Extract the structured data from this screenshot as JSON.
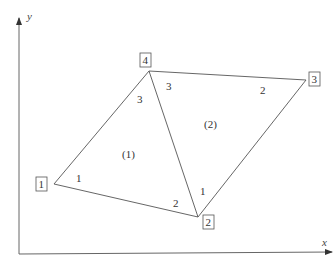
{
  "axes": {
    "x_label": "x",
    "y_label": "y"
  },
  "nodes": [
    {
      "id": "1",
      "x": 54,
      "y": 184,
      "label_x": 42,
      "label_y": 185
    },
    {
      "id": "2",
      "x": 198,
      "y": 217,
      "label_x": 209,
      "label_y": 223
    },
    {
      "id": "3",
      "x": 306,
      "y": 80,
      "label_x": 314,
      "label_y": 79
    },
    {
      "id": "4",
      "x": 149,
      "y": 71,
      "label_x": 143,
      "label_y": 60
    }
  ],
  "elements": [
    {
      "id": "(1)",
      "nodes": [
        "1",
        "2",
        "4"
      ],
      "label": "(1)",
      "label_x": 131,
      "label_y": 155,
      "local_nodes": [
        {
          "text": "1",
          "x": 79,
          "y": 179
        },
        {
          "text": "2",
          "x": 176,
          "y": 204
        },
        {
          "text": "3",
          "x": 140,
          "y": 100
        }
      ]
    },
    {
      "id": "(2)",
      "nodes": [
        "2",
        "3",
        "4"
      ],
      "label": "(2)",
      "label_x": 212,
      "label_y": 125,
      "local_nodes": [
        {
          "text": "1",
          "x": 203,
          "y": 192
        },
        {
          "text": "2",
          "x": 263,
          "y": 91
        },
        {
          "text": "3",
          "x": 169,
          "y": 87
        }
      ]
    }
  ]
}
